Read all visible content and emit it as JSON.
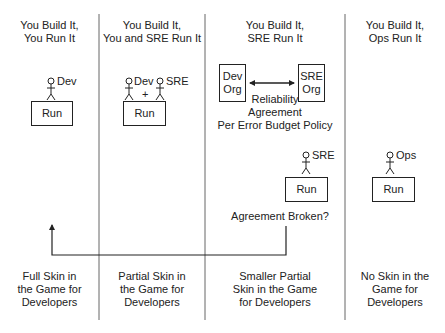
{
  "columns": [
    {
      "title_line1": "You Build It,",
      "title_line2": "You Run It",
      "actors": [
        "Dev"
      ],
      "run_box": "Run",
      "footer": [
        "Full Skin in",
        "the Game for",
        "Developers"
      ]
    },
    {
      "title_line1": "You Build It,",
      "title_line2": "You and SRE Run It",
      "actors": [
        "Dev",
        "SRE"
      ],
      "plus": "+",
      "run_box": "Run",
      "footer": [
        "Partial Skin in",
        "the Game for",
        "Developers"
      ]
    },
    {
      "title_line1": "You Build It,",
      "title_line2": "SRE Run It",
      "dev_org": [
        "Dev",
        "Org"
      ],
      "sre_org": [
        "SRE",
        "Org"
      ],
      "agreement": [
        "Reliability",
        "Agreement",
        "Per Error Budget Policy"
      ],
      "actors": [
        "SRE"
      ],
      "run_box": "Run",
      "broken_label": "Agreement Broken?",
      "footer": [
        "Smaller Partial",
        "Skin in the Game",
        "for Developers"
      ]
    },
    {
      "title_line1": "You Build It,",
      "title_line2": "Ops Run It",
      "actors": [
        "Ops"
      ],
      "run_box": "Run",
      "footer": [
        "No Skin in the",
        "Game for",
        "Developers"
      ]
    }
  ],
  "colors": {
    "line": "#222222",
    "divider": "#555555",
    "background": "#ffffff"
  }
}
